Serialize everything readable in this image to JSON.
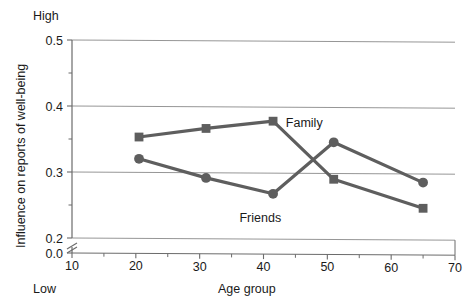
{
  "chart_data": {
    "type": "line",
    "title": "",
    "subtitle": "",
    "xlabel": "Age group",
    "ylabel": "Influence on reports of well-being",
    "xlim": [
      10,
      70
    ],
    "ylim": [
      0.2,
      0.5
    ],
    "y_axis_break": true,
    "y_axis_origin_label": "0.0",
    "grid": "horizontal",
    "legend_position": "inline-annotation",
    "x_ticks": [
      "10",
      "20",
      "30",
      "40",
      "50",
      "60",
      "70"
    ],
    "x_tick_values": [
      10,
      20,
      30,
      40,
      50,
      60,
      70
    ],
    "y_ticks": [
      "0.0",
      "0.2",
      "0.3",
      "0.4",
      "0.5"
    ],
    "y_tick_values": [
      0.0,
      0.2,
      0.3,
      0.4,
      0.5
    ],
    "y_minor_tick_values": [
      0.25,
      0.35,
      0.45
    ],
    "y_high_label": "High",
    "y_low_label": "Low",
    "x": [
      20.5,
      31,
      41.5,
      51,
      65
    ],
    "series": [
      {
        "name": "Family",
        "marker": "square",
        "color": "#5e5e5e",
        "values": [
          0.353,
          0.366,
          0.377,
          0.289,
          0.245
        ]
      },
      {
        "name": "Friends",
        "marker": "circle",
        "color": "#5e5e5e",
        "values": [
          0.32,
          0.291,
          0.267,
          0.345,
          0.284
        ]
      }
    ],
    "annotations": [
      {
        "text": "Family",
        "x": 43.5,
        "y": 0.375,
        "anchor": "start"
      },
      {
        "text": "Friends",
        "x": 39.5,
        "y": 0.231,
        "anchor": "middle"
      }
    ]
  },
  "style": {
    "line_color": "#5e5e5e",
    "grid_color": "#8a8a8a",
    "axis_color": "#6b6b6b",
    "text_color": "#1a1a1a",
    "background": "#ffffff"
  }
}
